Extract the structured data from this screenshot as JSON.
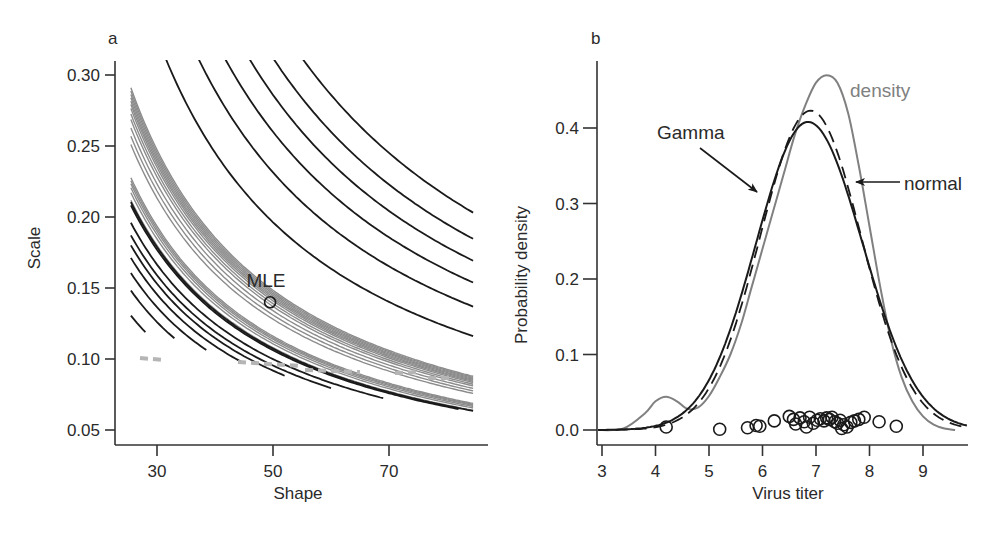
{
  "figure": {
    "panels": [
      "a",
      "b"
    ]
  },
  "chart_data": [
    {
      "panel": "a",
      "type": "contour",
      "title": "",
      "xlabel": "Shape",
      "ylabel": "Scale",
      "xlim": [
        23,
        87
      ],
      "ylim": [
        0.043,
        0.31
      ],
      "xticks": [
        30,
        50,
        70
      ],
      "xtick_labels": [
        "30",
        "50",
        "70"
      ],
      "yticks": [
        0.05,
        0.1,
        0.15,
        0.2,
        0.25,
        0.3
      ],
      "ytick_labels": [
        "0.05",
        "0.10",
        "0.15",
        "0.20",
        "0.25",
        "0.30"
      ],
      "grid": false,
      "annotations": [
        {
          "text": "MLE",
          "x": 49.5,
          "y": 0.14,
          "marker": "open-circle"
        }
      ],
      "mle": {
        "shape": 49.5,
        "scale": 0.14
      },
      "contour_families": {
        "grey_inner_levels_product_shape_x_scale": [
          6.4,
          6.55,
          6.7,
          6.85,
          6.95,
          7.05,
          7.12,
          7.18,
          7.24,
          7.3,
          7.36,
          7.42
        ],
        "grey_outer_levels_product_shape_x_scale": [
          6.0,
          6.15,
          6.25,
          6.33,
          6.39,
          6.45
        ],
        "black_upper_levels_product_shape_x_scale": [
          7.55,
          8.9,
          10.0,
          11.0,
          12.0,
          13.2
        ],
        "black_lower_levels_product_shape_x_scale": [
          3.7,
          4.2,
          4.55,
          4.85,
          5.1,
          5.3,
          5.55,
          5.9
        ]
      },
      "colors": {
        "black_contour": "#1a1a1a",
        "grey_contour": "#8c8c8c",
        "axis": "#333333"
      }
    },
    {
      "panel": "b",
      "type": "line",
      "title": "",
      "xlabel": "Virus titer",
      "ylabel": "Probability density",
      "xlim": [
        2.9,
        9.8
      ],
      "ylim": [
        -0.02,
        0.49
      ],
      "xticks": [
        3,
        4,
        5,
        6,
        7,
        8,
        9
      ],
      "xtick_labels": [
        "3",
        "4",
        "5",
        "6",
        "7",
        "8",
        "9"
      ],
      "yticks": [
        0.0,
        0.1,
        0.2,
        0.3,
        0.4
      ],
      "ytick_labels": [
        "0.0",
        "0.1",
        "0.2",
        "0.3",
        "0.4"
      ],
      "grid": false,
      "legend": "inline annotations",
      "series": [
        {
          "name": "density",
          "style": "solid-grey",
          "color": "#808080",
          "peak": {
            "x": 7.22,
            "y": 0.47
          },
          "x": [
            2.9,
            3.4,
            3.8,
            4.0,
            4.2,
            4.4,
            4.6,
            4.8,
            5.0,
            5.2,
            5.4,
            5.6,
            5.8,
            6.0,
            6.2,
            6.4,
            6.6,
            6.8,
            7.0,
            7.2,
            7.4,
            7.6,
            7.8,
            8.0,
            8.2,
            8.4,
            8.6,
            8.8,
            9.0,
            9.2,
            9.4,
            9.6
          ],
          "y": [
            0.0,
            0.002,
            0.022,
            0.038,
            0.044,
            0.038,
            0.028,
            0.03,
            0.045,
            0.07,
            0.1,
            0.14,
            0.19,
            0.24,
            0.29,
            0.34,
            0.39,
            0.43,
            0.46,
            0.47,
            0.46,
            0.42,
            0.35,
            0.27,
            0.19,
            0.12,
            0.07,
            0.038,
            0.018,
            0.007,
            0.002,
            0.0
          ]
        },
        {
          "name": "Gamma",
          "style": "solid-black",
          "color": "#1a1a1a",
          "peak": {
            "x": 6.85,
            "y": 0.408
          },
          "mean": 6.92,
          "sd": 0.98
        },
        {
          "name": "normal",
          "style": "dashed-black",
          "color": "#1a1a1a",
          "peak": {
            "x": 6.9,
            "y": 0.423
          },
          "mean": 6.9,
          "sd": 0.943
        }
      ],
      "points": {
        "label": "observations",
        "marker": "open-circle",
        "x": [
          4.2,
          5.2,
          5.72,
          5.88,
          5.95,
          6.22,
          6.5,
          6.58,
          6.62,
          6.7,
          6.78,
          6.82,
          6.88,
          6.95,
          7.02,
          7.08,
          7.15,
          7.2,
          7.25,
          7.3,
          7.35,
          7.4,
          7.45,
          7.48,
          7.52,
          7.58,
          7.65,
          7.72,
          7.8,
          7.9,
          8.18,
          8.5
        ],
        "y": [
          0.004,
          0.001,
          0.003,
          0.006,
          0.005,
          0.012,
          0.018,
          0.014,
          0.008,
          0.016,
          0.011,
          0.004,
          0.017,
          0.009,
          0.013,
          0.015,
          0.012,
          0.016,
          0.014,
          0.017,
          0.011,
          0.009,
          0.013,
          0.002,
          0.007,
          0.004,
          0.01,
          0.012,
          0.014,
          0.017,
          0.011,
          0.005
        ]
      },
      "annotations": [
        {
          "text": "density",
          "x": 8.35,
          "y": 0.452,
          "color": "#808080"
        },
        {
          "text": "Gamma",
          "x": 5.35,
          "y": 0.39,
          "arrow_to": {
            "x": 6.02,
            "y": 0.315
          }
        },
        {
          "text": "normal",
          "x": 8.95,
          "y": 0.327,
          "arrow_to": {
            "x": 7.78,
            "y": 0.327
          }
        }
      ]
    }
  ]
}
